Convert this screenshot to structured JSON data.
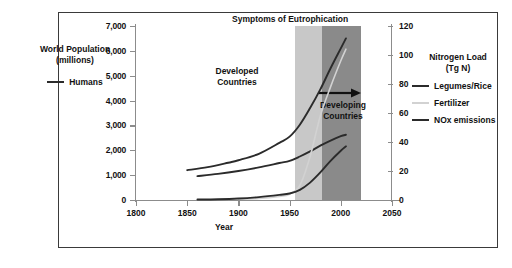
{
  "figure": {
    "band_title": "Symptoms of Eutrophication",
    "annotations": [
      {
        "name": "developed",
        "text_line1": "Developed",
        "text_line2": "Countries"
      },
      {
        "name": "developing",
        "text_line1": "Developing",
        "text_line2": "Countries"
      }
    ],
    "colors": {
      "band_developed": "#c8c8c8",
      "band_developing": "#8a8a8a",
      "curve_dark": "#2b2b2b",
      "curve_faint": "#d2d2d2",
      "axis": "#8c8c8c",
      "frame": "#3a3a3a"
    }
  },
  "left_axis_block": {
    "title_line1": "World Population",
    "title_line2": "(millions)",
    "legend_label": "Humans"
  },
  "right_legend": {
    "title_line1": "Nitrogen Load",
    "title_line2": "(Tg N)",
    "items": [
      {
        "label": "Legumes/Rice",
        "style": "solid-dark"
      },
      {
        "label": "Fertilizer",
        "style": "solid-faint"
      },
      {
        "label": "NOx emissions",
        "style": "solid-dark"
      }
    ]
  },
  "chart_data": {
    "type": "line",
    "title": "Symptoms of Eutrophication",
    "xlabel": "Year",
    "ylabel": "World Population (millions)",
    "y2label": "Nitrogen Load (Tg N)",
    "xlim": [
      1800,
      2050
    ],
    "ylim": [
      0,
      7000
    ],
    "y2lim": [
      0,
      120
    ],
    "xticks": [
      1800,
      1850,
      1900,
      1950,
      2000,
      2050
    ],
    "xticklabels": [
      "1800",
      "1850",
      "1900",
      "1950",
      "2000",
      "2050"
    ],
    "yticks": [
      0,
      1000,
      2000,
      3000,
      4000,
      5000,
      6000,
      7000
    ],
    "yticklabels": [
      "0",
      "1,000",
      "2,000",
      "3,000",
      "4,000",
      "5,000",
      "6,000",
      "7,000"
    ],
    "y2ticks": [
      0,
      20,
      40,
      60,
      80,
      100,
      120
    ],
    "y2ticklabels": [
      "0",
      "20",
      "40",
      "60",
      "80",
      "100",
      "120"
    ],
    "grid": false,
    "legend_position": "outside-right",
    "shaded_regions": [
      {
        "name": "developed",
        "x_start": 1955,
        "x_end": 1982,
        "color": "#c8c8c8"
      },
      {
        "name": "developing",
        "x_start": 1982,
        "x_end": 2020,
        "color": "#8a8a8a"
      }
    ],
    "series": [
      {
        "name": "Humans",
        "axis": "left",
        "unit": "millions",
        "x": [
          1850,
          1870,
          1890,
          1900,
          1920,
          1940,
          1950,
          1960,
          1970,
          1980,
          1990,
          2000,
          2005
        ],
        "values": [
          1200,
          1320,
          1500,
          1600,
          1860,
          2300,
          2550,
          3030,
          3700,
          4450,
          5300,
          6100,
          6500
        ]
      },
      {
        "name": "Legumes/Rice",
        "axis": "right",
        "unit": "Tg N",
        "x": [
          1860,
          1880,
          1900,
          1920,
          1940,
          1950,
          1960,
          1970,
          1980,
          1990,
          2000,
          2005
        ],
        "values": [
          16.5,
          18.0,
          20.0,
          22.5,
          25.5,
          27.0,
          30.0,
          33.5,
          37.5,
          41.0,
          44.0,
          45.0
        ]
      },
      {
        "name": "Fertilizer",
        "axis": "right",
        "unit": "Tg N",
        "x": [
          1900,
          1920,
          1940,
          1950,
          1960,
          1970,
          1980,
          1990,
          2000,
          2005
        ],
        "values": [
          0.5,
          1.0,
          2.5,
          4.0,
          10.0,
          30.0,
          58.0,
          78.0,
          96.0,
          104.0
        ]
      },
      {
        "name": "NOx emissions",
        "axis": "right",
        "unit": "Tg N",
        "x": [
          1860,
          1880,
          1900,
          1920,
          1940,
          1950,
          1960,
          1970,
          1980,
          1990,
          2000,
          2005
        ],
        "values": [
          0.3,
          0.5,
          1.0,
          2.0,
          3.5,
          4.5,
          7.0,
          12.0,
          19.0,
          27.0,
          34.0,
          37.0
        ]
      }
    ]
  }
}
